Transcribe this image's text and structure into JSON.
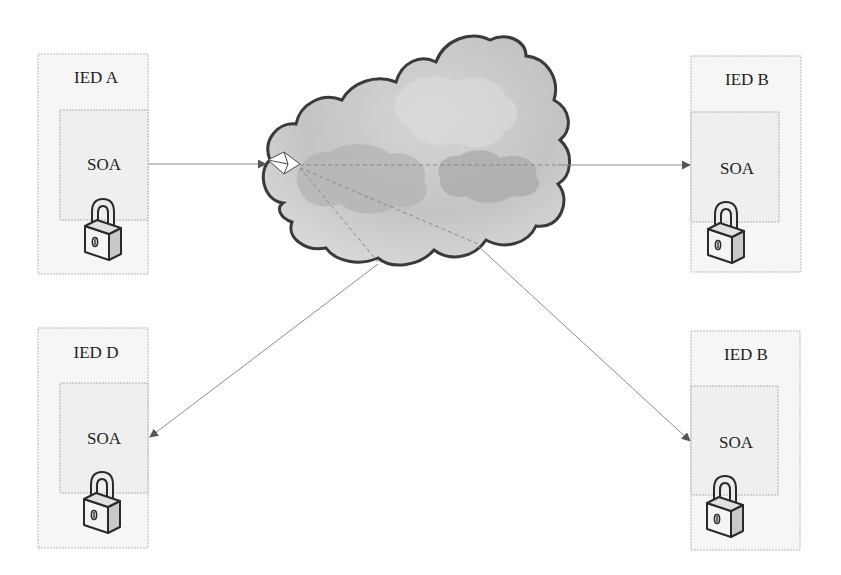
{
  "diagram": {
    "nodes": [
      {
        "id": "ied-a",
        "title": "IED A",
        "module": "SOA",
        "position": "top-left"
      },
      {
        "id": "ied-b-top",
        "title": "IED B",
        "module": "SOA",
        "position": "top-right"
      },
      {
        "id": "ied-d",
        "title": "IED D",
        "module": "SOA",
        "position": "bottom-left"
      },
      {
        "id": "ied-b-bottom",
        "title": "IED B",
        "module": "SOA",
        "position": "bottom-right"
      }
    ],
    "network": {
      "icon": "cloud-icon",
      "message_icon": "envelope-icon"
    },
    "edges": [
      {
        "from": "ied-a",
        "to": "network"
      },
      {
        "from": "network",
        "to": "ied-b-top"
      },
      {
        "from": "network",
        "to": "ied-d"
      },
      {
        "from": "network",
        "to": "ied-b-bottom"
      }
    ],
    "colors": {
      "cloud_fill": "#c9c9c9",
      "cloud_stroke": "#3a3a3a",
      "box_fill": "#f6f6f6",
      "line": "#8c8c8c"
    }
  }
}
